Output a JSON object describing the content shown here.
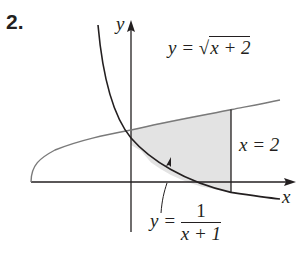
{
  "problem_number": "2.",
  "axes": {
    "x_label": "x",
    "y_label": "y"
  },
  "curves": {
    "upper": {
      "prefix": "y = ",
      "radical": "√",
      "radicand": "x + 2"
    },
    "lower": {
      "prefix": "y = ",
      "numerator": "1",
      "denominator": "x + 1"
    },
    "vertical": {
      "label": "x = 2"
    }
  },
  "colors": {
    "stroke": "#231f20",
    "curve_upper": "#7a7a7a",
    "shade": "#e3e3e3"
  }
}
